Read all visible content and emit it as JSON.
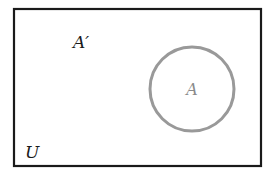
{
  "diagram": {
    "type": "venn",
    "universe": {
      "label": "U",
      "stroke": "#1a1a1a"
    },
    "complement": {
      "label": "A′"
    },
    "set_a": {
      "label": "A",
      "stroke": "#999999",
      "label_color": "#8a8a8a"
    }
  }
}
